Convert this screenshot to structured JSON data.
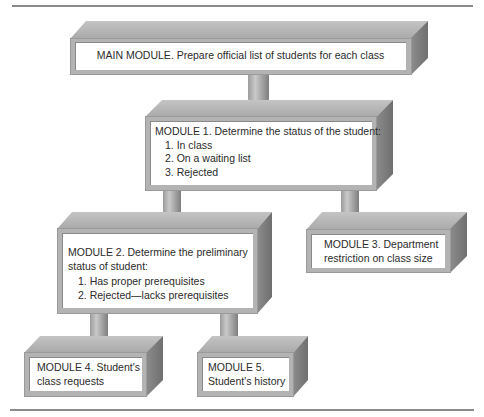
{
  "diagram": {
    "type": "hierarchy-chart",
    "modules": [
      {
        "id": "main",
        "title": "MAIN MODULE. Prepare official list of students for each class",
        "items": []
      },
      {
        "id": "module1",
        "title": "MODULE 1. Determine the status of the student:",
        "items": [
          "1. In class",
          "2. On a waiting list",
          "3. Rejected"
        ]
      },
      {
        "id": "module2",
        "title_line1": "MODULE 2. Determine the preliminary",
        "title_line2": "status of student:",
        "items": [
          "1. Has proper prerequisites",
          "2. Rejected—lacks prerequisites"
        ]
      },
      {
        "id": "module3",
        "title_line1": "MODULE 3. Department",
        "title_line2": "restriction on class size",
        "items": []
      },
      {
        "id": "module4",
        "title_line1": "MODULE 4. Student's",
        "title_line2": "class requests",
        "items": []
      },
      {
        "id": "module5",
        "title_line1": "MODULE 5.",
        "title_line2": "Student's history",
        "items": []
      }
    ],
    "connections": [
      {
        "from": "main",
        "to": "module1"
      },
      {
        "from": "module1",
        "to": "module2"
      },
      {
        "from": "module1",
        "to": "module3"
      },
      {
        "from": "module2",
        "to": "module4"
      },
      {
        "from": "module2",
        "to": "module5"
      }
    ],
    "colors": {
      "face_top": "#bdbdbd",
      "face_side": "#7e7e7e",
      "face_front": "#b3b3b3",
      "panel": "#ffffff",
      "rule": "#8a8a8a"
    }
  }
}
